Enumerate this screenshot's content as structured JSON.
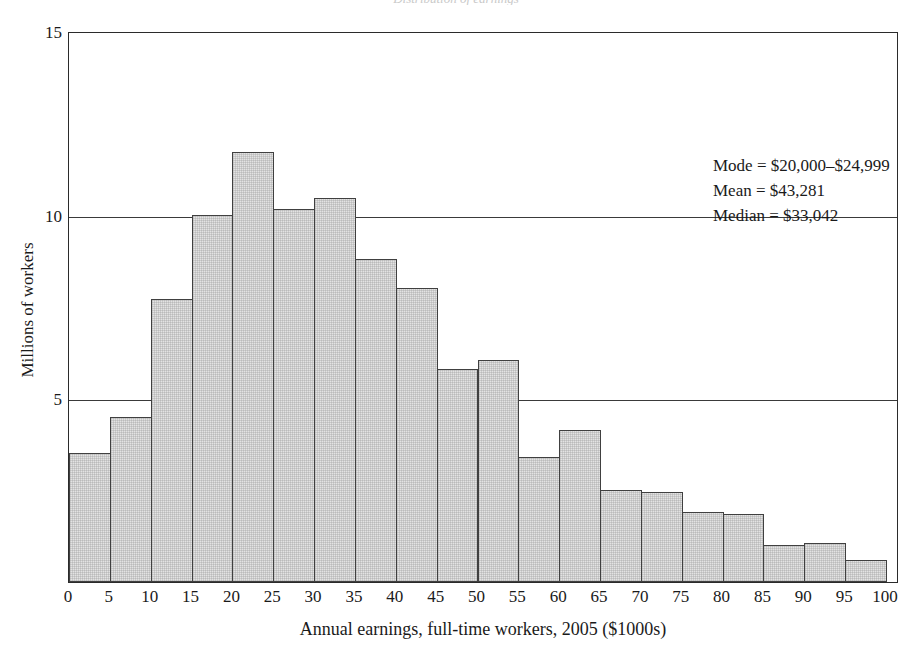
{
  "figure": {
    "cropped_title_sliver": "Distribution of earnings",
    "xlabel": "Annual earnings, full-time workers, 2005 ($1000s)",
    "ylabel": "Millions of workers"
  },
  "annotations": {
    "mode": "Mode = $20,000–$24,999",
    "mean": "Mean = $43,281",
    "median": "Median = $33,042"
  },
  "axes": {
    "y_ticks": [
      "0",
      "5",
      "10",
      "15"
    ],
    "x_ticks": [
      "0",
      "5",
      "10",
      "15",
      "20",
      "25",
      "30",
      "35",
      "40",
      "45",
      "50",
      "55",
      "60",
      "65",
      "70",
      "75",
      "80",
      "85",
      "90",
      "95",
      "100"
    ]
  },
  "style": {
    "bar_fill": "#e3e3e3",
    "bar_stroke": "#404040",
    "axis_color": "#2b2b2b"
  },
  "chart_data": {
    "type": "bar",
    "title": "",
    "xlabel": "Annual earnings, full-time workers, 2005 ($1000s)",
    "ylabel": "Millions of workers",
    "xlim": [
      0,
      100
    ],
    "ylim": [
      0,
      15
    ],
    "grid": true,
    "gridlines_y": [
      5,
      10
    ],
    "legend": "none",
    "bin_width": 5,
    "bin_edges": [
      0,
      5,
      10,
      15,
      20,
      25,
      30,
      35,
      40,
      45,
      50,
      55,
      60,
      65,
      70,
      75,
      80,
      85,
      90,
      95,
      100
    ],
    "categories": [
      "0–5",
      "5–10",
      "10–15",
      "15–20",
      "20–25",
      "25–30",
      "30–35",
      "35–40",
      "40–45",
      "45–50",
      "50–55",
      "55–60",
      "60–65",
      "65–70",
      "70–75",
      "75–80",
      "80–85",
      "85–90",
      "90–95",
      "95–100"
    ],
    "values": [
      3.5,
      4.5,
      7.7,
      10.0,
      11.7,
      10.15,
      10.45,
      8.8,
      8.0,
      5.8,
      6.05,
      3.4,
      4.15,
      2.5,
      2.45,
      1.9,
      1.85,
      1.0,
      1.05,
      0.6
    ],
    "annotations": [
      "Mode = $20,000–$24,999",
      "Mean = $43,281",
      "Median = $33,042"
    ]
  }
}
